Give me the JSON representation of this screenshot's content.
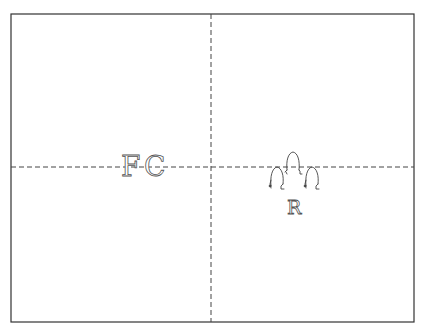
{
  "diagram": {
    "type": "quadrant-sketch",
    "frame": {
      "x1": 11,
      "y1": 14,
      "x2": 414,
      "y2": 322,
      "stroke": "#333333"
    },
    "divider_vertical_x": 211,
    "divider_horizontal_y": 167,
    "divider_style": "dashed",
    "labels": {
      "left_f": "F",
      "left_c": "C",
      "right": "R"
    },
    "figures": [
      {
        "name": "figure-left",
        "x": 276,
        "y": 178
      },
      {
        "name": "figure-center",
        "x": 293,
        "y": 162
      },
      {
        "name": "figure-right",
        "x": 311,
        "y": 178
      }
    ],
    "colors": {
      "line": "#333333",
      "dash": "#444444",
      "ink": "#555555",
      "background": "#ffffff"
    }
  }
}
